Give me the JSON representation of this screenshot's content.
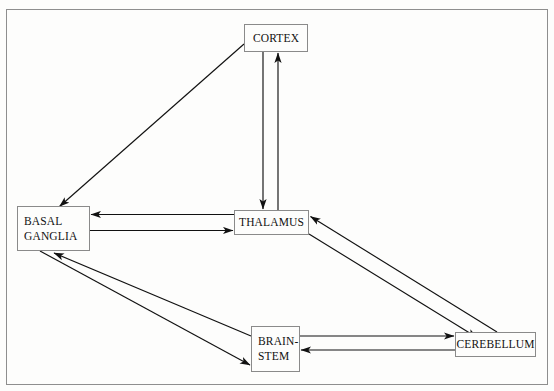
{
  "diagram": {
    "background_color": "#fdfdfc",
    "line_color": "#1a1a1a",
    "border_color": "#8e8e8e",
    "nodes": [
      {
        "id": "cortex",
        "label": "CORTEX"
      },
      {
        "id": "thalamus",
        "label": "THALAMUS"
      },
      {
        "id": "basal_ganglia",
        "label": "BASAL\nGANGLIA"
      },
      {
        "id": "brain_stem",
        "label": "BRAIN-\nSTEM"
      },
      {
        "id": "cerebellum",
        "label": "CEREBELLUM"
      }
    ],
    "edges": [
      {
        "from": "cortex",
        "to": "basal_ganglia",
        "style": "diagonal",
        "arrow": "single"
      },
      {
        "from": "cortex",
        "to": "thalamus",
        "style": "vertical",
        "arrow": "single"
      },
      {
        "from": "thalamus",
        "to": "cortex",
        "style": "vertical",
        "arrow": "single"
      },
      {
        "from": "thalamus",
        "to": "basal_ganglia",
        "style": "horizontal",
        "arrow": "single"
      },
      {
        "from": "basal_ganglia",
        "to": "thalamus",
        "style": "horizontal",
        "arrow": "single"
      },
      {
        "from": "thalamus",
        "to": "cerebellum",
        "style": "diagonal",
        "arrow": "single"
      },
      {
        "from": "cerebellum",
        "to": "thalamus",
        "style": "diagonal",
        "arrow": "single"
      },
      {
        "from": "basal_ganglia",
        "to": "brain_stem",
        "style": "diagonal",
        "arrow": "single"
      },
      {
        "from": "brain_stem",
        "to": "basal_ganglia",
        "style": "diagonal",
        "arrow": "single"
      },
      {
        "from": "brain_stem",
        "to": "cerebellum",
        "style": "horizontal",
        "arrow": "single"
      },
      {
        "from": "cerebellum",
        "to": "brain_stem",
        "style": "horizontal",
        "arrow": "single"
      }
    ]
  }
}
